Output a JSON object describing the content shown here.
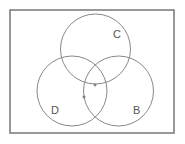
{
  "diagram": {
    "type": "venn",
    "frame": {
      "x": 10,
      "y": 10,
      "width": 164,
      "height": 123,
      "stroke": "#777777"
    },
    "circles": [
      {
        "id": "C",
        "label": "C",
        "cx": 95.5,
        "cy": 49,
        "r": 35,
        "label_x": 113,
        "label_y": 38
      },
      {
        "id": "D",
        "label": "D",
        "cx": 72,
        "cy": 91,
        "r": 35,
        "label_x": 51,
        "label_y": 114
      },
      {
        "id": "B",
        "label": "B",
        "cx": 118.5,
        "cy": 91,
        "r": 35,
        "label_x": 133,
        "label_y": 114
      }
    ],
    "circle_stroke": "#888888",
    "marks": [
      {
        "x": 95,
        "y": 85
      },
      {
        "x": 84,
        "y": 97
      }
    ]
  }
}
